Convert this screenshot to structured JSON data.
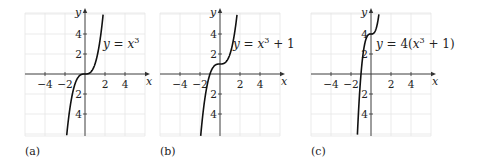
{
  "figure": {
    "panels": [
      {
        "caption": "(a)",
        "equation_parts": [
          {
            "t": "y",
            "i": true
          },
          {
            "t": " = ",
            "i": false
          },
          {
            "t": "x",
            "i": true
          },
          {
            "t": "3",
            "sup": true
          }
        ]
      },
      {
        "caption": "(b)",
        "equation_parts": [
          {
            "t": "y",
            "i": true
          },
          {
            "t": " = ",
            "i": false
          },
          {
            "t": "x",
            "i": true
          },
          {
            "t": "3",
            "sup": true
          },
          {
            "t": " + 1",
            "i": false
          }
        ]
      },
      {
        "caption": "(c)",
        "equation_parts": [
          {
            "t": "y",
            "i": true
          },
          {
            "t": " = 4(",
            "i": false
          },
          {
            "t": "x",
            "i": true
          },
          {
            "t": "3",
            "sup": true
          },
          {
            "t": " + 1)",
            "i": false
          }
        ]
      }
    ]
  },
  "chart_data": [
    {
      "type": "line",
      "title": "y = x^3",
      "caption": "(a)",
      "xlabel": "x",
      "ylabel": "y",
      "xlim": [
        -6,
        6
      ],
      "ylim": [
        -6.2,
        6
      ],
      "xticks": [
        -4,
        -2,
        2,
        4
      ],
      "yticks": [
        -4,
        -2,
        2,
        4
      ],
      "xtick_labels": [
        "−4",
        "−2",
        "2",
        "4"
      ],
      "ytick_labels": [
        "−4",
        "−2",
        "2",
        "4"
      ],
      "grid": true,
      "function": {
        "a": 1,
        "c": 0
      },
      "series": [
        {
          "name": "y = x^3",
          "x": [
            -1.84,
            -1.5,
            -1,
            -0.5,
            0,
            0.5,
            1,
            1.5,
            1.82
          ],
          "y": [
            -6.2,
            -3.375,
            -1,
            -0.125,
            0,
            0.125,
            1,
            3.375,
            6
          ]
        }
      ],
      "annotation": {
        "text": "y = x^3",
        "x": 1.8,
        "y": 2.5
      }
    },
    {
      "type": "line",
      "title": "y = x^3 + 1",
      "caption": "(b)",
      "xlabel": "x",
      "ylabel": "y",
      "xlim": [
        -6,
        6
      ],
      "ylim": [
        -6.2,
        6
      ],
      "xticks": [
        -4,
        -2,
        2,
        4
      ],
      "yticks": [
        -4,
        -2,
        2,
        4
      ],
      "xtick_labels": [
        "−4",
        "−2",
        "2",
        "4"
      ],
      "ytick_labels": [
        "−4",
        "−2",
        "2",
        "4"
      ],
      "grid": true,
      "function": {
        "a": 1,
        "c": 1
      },
      "series": [
        {
          "name": "y = x^3 + 1",
          "x": [
            -1.93,
            -1.5,
            -1,
            -0.5,
            0,
            0.5,
            1,
            1.5,
            1.71
          ],
          "y": [
            -6.2,
            -2.375,
            0,
            0.875,
            1,
            1.125,
            2,
            4.375,
            6
          ]
        }
      ],
      "annotation": {
        "text": "y = x^3 + 1",
        "x": 1.3,
        "y": 2.5
      }
    },
    {
      "type": "line",
      "title": "y = 4(x^3 + 1)",
      "caption": "(c)",
      "xlabel": "x",
      "ylabel": "y",
      "xlim": [
        -6,
        6
      ],
      "ylim": [
        -6.2,
        6
      ],
      "xticks": [
        -4,
        -2,
        2,
        4
      ],
      "yticks": [
        -4,
        -2,
        2,
        4
      ],
      "xtick_labels": [
        "−4",
        "−2",
        "2",
        "4"
      ],
      "ytick_labels": [
        "−4",
        "−2",
        "2",
        "4"
      ],
      "grid": true,
      "function": {
        "a": 4,
        "c": 1
      },
      "series": [
        {
          "name": "y = 4(x^3 + 1)",
          "x": [
            -1.37,
            -1.2,
            -1,
            -0.5,
            0,
            0.5,
            0.79
          ],
          "y": [
            -6.2,
            -2.91,
            0,
            3.5,
            4,
            4.5,
            6
          ]
        }
      ],
      "annotation": {
        "text": "y = 4(x^3 + 1)",
        "x": 0.5,
        "y": 2.5
      }
    }
  ]
}
